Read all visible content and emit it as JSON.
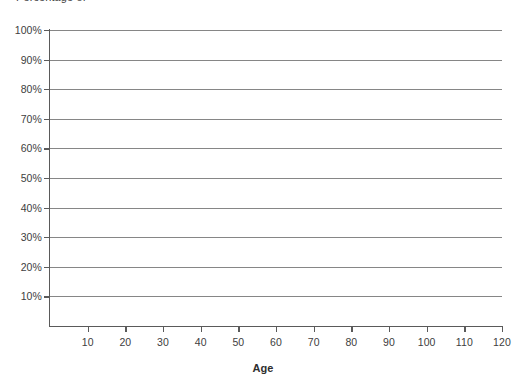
{
  "chart_data": {
    "type": "line",
    "title": "",
    "title_clipped": "Percentage of",
    "xlabel": "Age",
    "ylabel": "",
    "x_ticks": [
      10,
      20,
      30,
      40,
      50,
      60,
      70,
      80,
      90,
      100,
      110,
      120
    ],
    "x_tick_labels": [
      "10",
      "20",
      "30",
      "40",
      "50",
      "60",
      "70",
      "80",
      "90",
      "100",
      "110",
      "120"
    ],
    "xlim": [
      0,
      120
    ],
    "y_ticks": [
      10,
      20,
      30,
      40,
      50,
      60,
      70,
      80,
      90,
      100
    ],
    "y_tick_labels": [
      "10%",
      "20%",
      "30%",
      "40%",
      "50%",
      "60%",
      "70%",
      "80%",
      "90%",
      "100%"
    ],
    "ylim": [
      0,
      100
    ],
    "grid": "horizontal",
    "legend": "none",
    "series": [],
    "values": [],
    "categories": [],
    "annotations": [],
    "colors": {
      "gridline": "#868686",
      "axis": "#5a5a5a",
      "tick_text": "#404040",
      "axis_title": "#2e2e2e",
      "background": "#ffffff"
    }
  }
}
